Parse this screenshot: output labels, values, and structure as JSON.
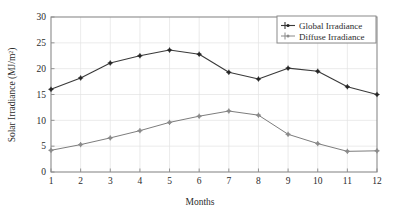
{
  "chart_data": {
    "type": "line",
    "title": "",
    "xlabel": "Months",
    "ylabel": "Solar Irradiance (MJ/m²)",
    "categories": [
      "1",
      "2",
      "3",
      "4",
      "5",
      "6",
      "7",
      "8",
      "9",
      "10",
      "11",
      "12"
    ],
    "x": [
      1,
      2,
      3,
      4,
      5,
      6,
      7,
      8,
      9,
      10,
      11,
      12
    ],
    "xlim": [
      1,
      12
    ],
    "ylim": [
      0,
      30
    ],
    "yticks": [
      "0",
      "5",
      "10",
      "15",
      "20",
      "25",
      "30"
    ],
    "ytick_values": [
      0,
      5,
      10,
      15,
      20,
      25,
      30
    ],
    "xticks": [
      "1",
      "2",
      "3",
      "4",
      "5",
      "6",
      "7",
      "8",
      "9",
      "10",
      "11",
      "12"
    ],
    "grid": true,
    "legend_position": "top-right",
    "series": [
      {
        "name": "Global Irradiance",
        "color": "#3a3a3a",
        "marker": "plus-dot",
        "values": [
          16.0,
          18.2,
          21.1,
          22.5,
          23.6,
          22.8,
          19.3,
          18.0,
          20.1,
          19.5,
          16.5,
          15.0
        ]
      },
      {
        "name": "Diffuse Irradiance",
        "color": "#8a8a8a",
        "marker": "plus-dot",
        "values": [
          4.2,
          5.3,
          6.6,
          8.0,
          9.6,
          10.8,
          11.8,
          11.0,
          7.3,
          5.5,
          4.0,
          4.1
        ]
      }
    ]
  },
  "colors": {
    "global": "#3a3a3a",
    "diffuse": "#8a8a8a",
    "frame": "#8a8a8a",
    "grid": "#e3e3e3",
    "background": "#ffffff"
  }
}
